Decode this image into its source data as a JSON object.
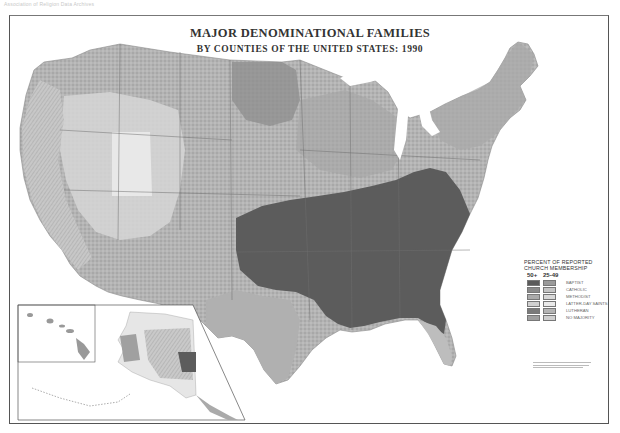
{
  "watermark": "Association of Religion Data Archives",
  "map": {
    "title": "MAJOR DENOMINATIONAL FAMILIES",
    "subtitle": "BY COUNTIES OF THE UNITED STATES: 1990"
  },
  "legend": {
    "title_line1": "PERCENT OF REPORTED",
    "title_line2": "CHURCH MEMBERSHIP",
    "col_high": "50+",
    "col_mid": "25-49",
    "items": [
      {
        "label": "BAPTIST",
        "high_color": "#5a5a5a",
        "mid_color": "#9a9a9a"
      },
      {
        "label": "CATHOLIC",
        "high_color": "#8a8a8a",
        "mid_color": "#c4c4c4"
      },
      {
        "label": "METHODIST",
        "high_color": "#aaaaaa",
        "mid_color": "#d8d8d8"
      },
      {
        "label": "LATTER-DAY SAINTS",
        "high_color": "#d0d0d0",
        "mid_color": "#eaeaea"
      },
      {
        "label": "LUTHERAN",
        "high_color": "#7a7a7a",
        "mid_color": "#b4b4b4"
      },
      {
        "label": "NO MAJORITY",
        "high_color": "#9e9e9e",
        "mid_color": "#cfcfcf"
      }
    ]
  },
  "colors": {
    "baptist_dark": "#5c5c5c",
    "catholic": "#a8a8a8",
    "mixed": "#b8b8b8",
    "lds_light": "#dcdcdc",
    "lutheran": "#8c8c8c",
    "frame": "#555555"
  }
}
